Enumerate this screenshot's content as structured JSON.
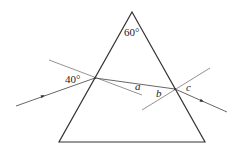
{
  "diagram": {
    "type": "prism-refraction",
    "colors": {
      "prism": "#333333",
      "ray": "#555555",
      "normal": "#777777",
      "text": "#222222"
    },
    "prism": {
      "apex": [
        132,
        12
      ],
      "bottom_left": [
        59,
        142
      ],
      "bottom_right": [
        205,
        142
      ]
    },
    "rays": {
      "incident": {
        "from": [
          16,
          106
        ],
        "to": [
          95,
          78
        ],
        "arrow_at": [
          43,
          96
        ]
      },
      "internal": {
        "from": [
          95,
          78
        ],
        "to": [
          175,
          89
        ]
      },
      "emergent": {
        "from": [
          175,
          89
        ],
        "to": [
          227,
          112
        ],
        "arrow_at": [
          202,
          101
        ]
      }
    },
    "normals": {
      "left": {
        "from": [
          49,
          60
        ],
        "to": [
          142,
          95
        ]
      },
      "right": {
        "from": [
          142,
          110
        ],
        "to": [
          210,
          68
        ]
      }
    },
    "labels": {
      "apex_angle": {
        "text": "60°",
        "pos": [
          124,
          36
        ]
      },
      "incidence_angle": {
        "text": "40°",
        "pos": [
          65,
          83
        ]
      },
      "a": {
        "text": "a",
        "pos": [
          135,
          90
        ]
      },
      "b": {
        "text": "b",
        "pos": [
          156,
          97
        ]
      },
      "c": {
        "text": "c",
        "pos": [
          186,
          91
        ]
      }
    }
  }
}
